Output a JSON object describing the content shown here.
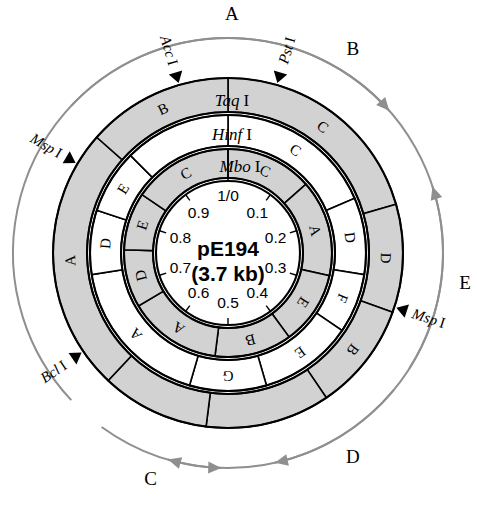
{
  "plasmid": {
    "name": "pE194",
    "size": "(3.7 kb)",
    "units": "kb fraction"
  },
  "scale": {
    "origin_label": "1/0",
    "ticks": [
      "0.1",
      "0.2",
      "0.3",
      "0.4",
      "0.5",
      "0.6",
      "0.7",
      "0.8",
      "0.9"
    ]
  },
  "rings": [
    {
      "enzyme": "Taq",
      "enzyme_numeral": "I",
      "segments": [
        {
          "label": "C",
          "start": 0.0,
          "end": 0.205,
          "shade": "gray"
        },
        {
          "label": "D",
          "start": 0.205,
          "end": 0.305,
          "shade": "gray"
        },
        {
          "label": "B",
          "start": 0.305,
          "end": 0.405,
          "shade": "gray"
        },
        {
          "label": "",
          "start": 0.405,
          "end": 0.52,
          "shade": "gray"
        },
        {
          "label": "",
          "start": 0.52,
          "end": 0.62,
          "shade": "gray"
        },
        {
          "label": "A",
          "start": 0.62,
          "end": 0.865,
          "shade": "gray"
        },
        {
          "label": "B",
          "start": 0.865,
          "end": 1.0,
          "shade": "gray"
        }
      ]
    },
    {
      "enzyme": "Hinf",
      "enzyme_numeral": "I",
      "segments": [
        {
          "label": "C",
          "start": 0.0,
          "end": 0.185,
          "shade": "white"
        },
        {
          "label": "D",
          "start": 0.185,
          "end": 0.275,
          "shade": "white"
        },
        {
          "label": "F",
          "start": 0.275,
          "end": 0.345,
          "shade": "white"
        },
        {
          "label": "E",
          "start": 0.345,
          "end": 0.455,
          "shade": "white"
        },
        {
          "label": "G",
          "start": 0.455,
          "end": 0.545,
          "shade": "white"
        },
        {
          "label": "A",
          "start": 0.545,
          "end": 0.725,
          "shade": "white"
        },
        {
          "label": "D",
          "start": 0.725,
          "end": 0.8,
          "shade": "white"
        },
        {
          "label": "E",
          "start": 0.8,
          "end": 0.875,
          "shade": "white"
        },
        {
          "label": "",
          "start": 0.875,
          "end": 1.0,
          "shade": "white"
        }
      ]
    },
    {
      "enzyme": "Mbo",
      "enzyme_numeral": "I",
      "segments": [
        {
          "label": "C",
          "start": 0.0,
          "end": 0.135,
          "shade": "gray"
        },
        {
          "label": "A",
          "start": 0.135,
          "end": 0.285,
          "shade": "gray"
        },
        {
          "label": "E",
          "start": 0.285,
          "end": 0.4,
          "shade": "gray"
        },
        {
          "label": "B",
          "start": 0.4,
          "end": 0.52,
          "shade": "gray"
        },
        {
          "label": "A",
          "start": 0.52,
          "end": 0.665,
          "shade": "gray"
        },
        {
          "label": "D",
          "start": 0.665,
          "end": 0.755,
          "shade": "gray"
        },
        {
          "label": "E",
          "start": 0.755,
          "end": 0.845,
          "shade": "gray"
        },
        {
          "label": "C",
          "start": 0.845,
          "end": 1.0,
          "shade": "gray"
        }
      ]
    }
  ],
  "site_markers": [
    {
      "name": "Acc",
      "numeral": "I",
      "pos": 0.955
    },
    {
      "name": "Pst",
      "numeral": "I",
      "pos": 0.045
    },
    {
      "name": "Msp",
      "numeral": "I",
      "pos": 0.835
    },
    {
      "name": "Msp",
      "numeral": "I",
      "pos": 0.3
    },
    {
      "name": "Bcl",
      "numeral": "I",
      "pos": 0.655
    }
  ],
  "outer_arcs": [
    {
      "letter": "A",
      "start": 0.87,
      "end": 0.135,
      "direction": "cw"
    },
    {
      "letter": "E",
      "start": 0.34,
      "end": 0.2,
      "direction": "ccw"
    },
    {
      "letter": "D",
      "start": 0.36,
      "end": 0.465,
      "direction": "cw"
    },
    {
      "letter": "C",
      "start": 0.6,
      "end": 0.505,
      "direction": "ccw"
    },
    {
      "letter": "B",
      "start": 0.63,
      "end": 0.545,
      "direction": "cw"
    }
  ],
  "colors": {
    "segment_gray": "#d2d2d2",
    "outline": "#000000",
    "arc_gray": "#8f8f8f",
    "background": "#ffffff"
  }
}
